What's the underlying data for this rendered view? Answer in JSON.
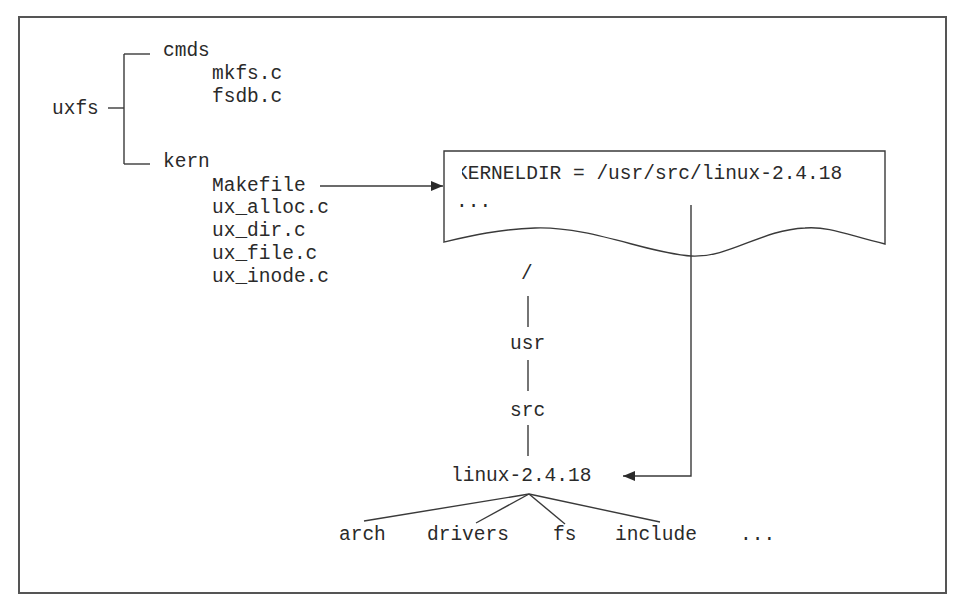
{
  "source_tree": {
    "root": "uxfs",
    "cmds": {
      "label": "cmds",
      "files": [
        "mkfs.c",
        "fsdb.c"
      ]
    },
    "kern": {
      "label": "kern",
      "files": [
        "Makefile",
        "ux_alloc.c",
        "ux_dir.c",
        "ux_file.c",
        "ux_inode.c"
      ]
    }
  },
  "makefile_box": {
    "line1": "KERNELDIR = /usr/src/linux-2.4.18",
    "line2": "..."
  },
  "kernel_path": {
    "root": "/",
    "usr": "usr",
    "src": "src",
    "linux": "linux-2.4.18",
    "children": [
      "arch",
      "drivers",
      "fs",
      "include",
      "..."
    ]
  },
  "colors": {
    "line": "#3a3a3a",
    "text": "#2a2a2a",
    "frame": "#555555",
    "background": "#ffffff"
  }
}
